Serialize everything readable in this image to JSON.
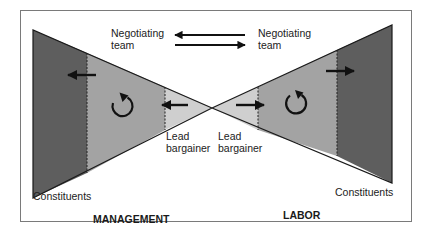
{
  "diagram": {
    "colors": {
      "background": "#ffffff",
      "frame": "#7a7a7a",
      "dark_band": "#5e5e5e",
      "medium_band": "#a3a3a3",
      "light_band": "#cfcfcf",
      "outline": "#1a1a1a",
      "text": "#222222"
    },
    "labels": {
      "negotiating_team_left_line1": "Negotiating",
      "negotiating_team_left_line2": "team",
      "negotiating_team_right_line1": "Negotiating",
      "negotiating_team_right_line2": "team",
      "lead_bargainer_left_line1": "Lead",
      "lead_bargainer_left_line2": "bargainer",
      "lead_bargainer_right_line1": "Lead",
      "lead_bargainer_right_line2": "bargainer",
      "constituents_left": "Constituents",
      "constituents_right": "Constituents",
      "side_left": "MANAGEMENT",
      "side_right": "LABOR"
    },
    "sides": [
      {
        "name": "Management",
        "bands": [
          "Constituents",
          "Negotiating team",
          "Lead bargainer"
        ],
        "arrows": [
          "outward-left arrow in team band",
          "leftward arrow in lead bargainer band",
          "circular arrow in team band"
        ]
      },
      {
        "name": "Labor",
        "bands": [
          "Lead bargainer",
          "Negotiating team",
          "Constituents"
        ],
        "arrows": [
          "rightward arrow in lead bargainer band",
          "outward-right arrow in team band",
          "circular arrow in team band"
        ]
      }
    ],
    "center_arrows": [
      "arrow pointing left (labor to management)",
      "arrow pointing right (management to labor)"
    ]
  }
}
